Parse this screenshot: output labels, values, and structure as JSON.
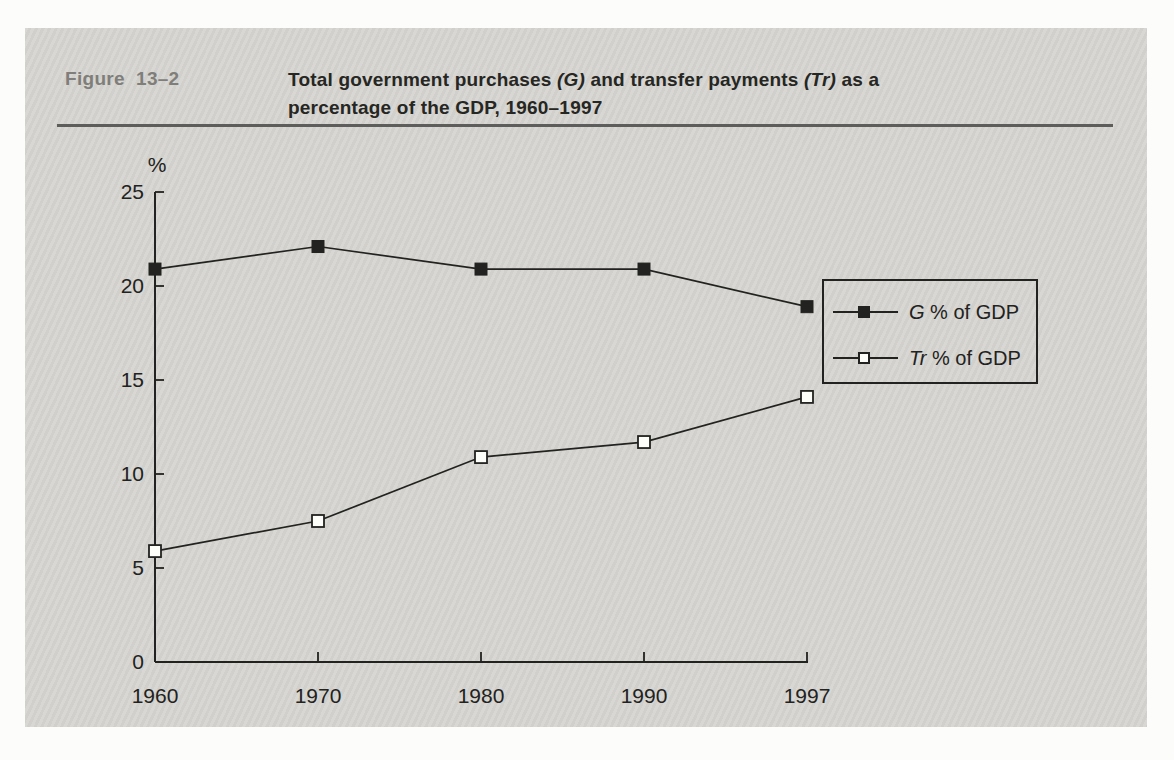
{
  "figure_label": "Figure  13–2",
  "title": {
    "segment1": "Total government purchases ",
    "g_italic": "(G)",
    "segment2": " and transfer payments ",
    "tr_italic": "(Tr)",
    "segment3": " as a",
    "line2": "percentage of the GDP, 1960–1997"
  },
  "chart_data": {
    "type": "line",
    "title": "Total government purchases (G) and transfer payments (Tr) as a percentage of the GDP, 1960–1997",
    "categories": [
      "1960",
      "1970",
      "1980",
      "1990",
      "1997"
    ],
    "series": [
      {
        "name": "G % of GDP",
        "label_italic": "G",
        "label_rest": " % of GDP",
        "marker": "filled-square",
        "values": [
          20.9,
          22.1,
          20.9,
          20.9,
          18.9
        ]
      },
      {
        "name": "Tr % of GDP",
        "label_italic": "Tr",
        "label_rest": " % of GDP",
        "marker": "open-square",
        "values": [
          5.9,
          7.5,
          10.9,
          11.7,
          14.1
        ]
      }
    ],
    "ylabel": "%",
    "xlabel": "",
    "y_ticks": [
      0,
      5,
      10,
      15,
      20,
      25
    ],
    "ylim": [
      0,
      25
    ],
    "grid": false,
    "legend_position": "inside-right"
  },
  "colors": {
    "ink": "#222220",
    "card_bg": "#d6d5d1",
    "page_bg": "#fcfcfb",
    "figure_label": "#7f7e7a",
    "title": "#262622",
    "rule": "#5d5d5b",
    "open_marker_fill": "#fdfdfa"
  }
}
